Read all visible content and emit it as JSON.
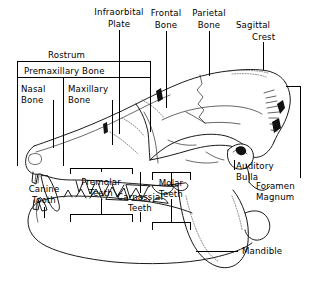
{
  "figure": {
    "line_color": "#111111",
    "background_color": "#ffffff"
  },
  "labels": {
    "rostrum": "Rostrum",
    "premaxillary_bone": "Premaxillary  Bone",
    "nasal_bone_line1": "Nasal",
    "nasal_bone_line2": "Bone",
    "maxillary_bone_line1": "Maxillary",
    "maxillary_bone_line2": "Bone",
    "infraorbital_line1": "Infraorbital",
    "infraorbital_line2": "Plate",
    "frontal_line1": "Frontal",
    "frontal_line2": "Bone",
    "parietal_line1": "Parietal",
    "parietal_line2": "Bone",
    "sagittal_line1": "Sagittal",
    "sagittal_line2": "Crest",
    "auditory_line1": "Auditory",
    "auditory_line2": "Bulla",
    "foramen_line1": "Foramen",
    "foramen_line2": "Magnum",
    "canine_line1": "Canine",
    "canine_line2": "Tooth",
    "premolar_line1": "Premolar",
    "premolar_line2": "Teeth",
    "carnassial_line1": "Carnassial",
    "carnassial_line2": "Teeth",
    "molar_line1": "Molar",
    "molar_line2": "Teeth",
    "mandible": "Mandible"
  },
  "structures": [
    {
      "name": "rostrum",
      "region": "snout"
    },
    {
      "name": "premaxillary-bone",
      "region": "snout-front"
    },
    {
      "name": "nasal-bone",
      "region": "snout-top"
    },
    {
      "name": "maxillary-bone",
      "region": "snout-side"
    },
    {
      "name": "infraorbital-plate",
      "region": "orbit-front"
    },
    {
      "name": "frontal-bone",
      "region": "cranium-front"
    },
    {
      "name": "parietal-bone",
      "region": "cranium-rear"
    },
    {
      "name": "sagittal-crest",
      "region": "cranium-top-rear"
    },
    {
      "name": "auditory-bulla",
      "region": "skull-base-rear"
    },
    {
      "name": "foramen-magnum",
      "region": "occiput"
    },
    {
      "name": "canine-tooth",
      "region": "upper-front"
    },
    {
      "name": "premolar-teeth",
      "region": "upper-mid"
    },
    {
      "name": "carnassial-teeth",
      "region": "lower-mid"
    },
    {
      "name": "molar-teeth",
      "region": "upper-rear"
    },
    {
      "name": "mandible",
      "region": "lower-jaw"
    }
  ]
}
